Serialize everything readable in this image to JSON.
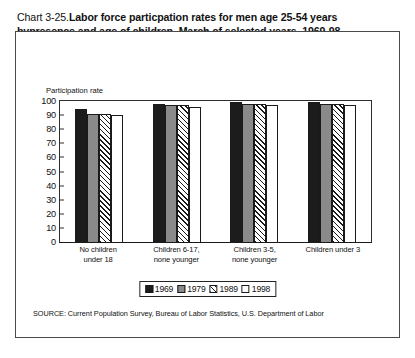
{
  "figure": {
    "title_number": "Chart 3-25.",
    "title_text": "Labor force particpation rates for men age 25-54 years bypresence and age of children, March of selected years, 1969-98",
    "source_note": "SOURCE: Current Population Survey, Bureau of Labor Statistics, U.S. Department of Labor",
    "axis_title": "Participation rate"
  },
  "chart_data": {
    "type": "bar",
    "title": "Chart 3-25.Labor force particpation rates for men age 25-54 years bypresence and age of children, March of selected years, 1969-98",
    "xlabel": "",
    "ylabel": "Participation rate",
    "ylim": [
      0,
      100
    ],
    "yticks": [
      0,
      10,
      20,
      30,
      40,
      50,
      60,
      70,
      80,
      90,
      100
    ],
    "grid": false,
    "legend_position": "bottom",
    "categories": [
      "No children under 18",
      "Children 6-17, none younger",
      "Children 3-5, none younger",
      "Children under 3"
    ],
    "category_lines": [
      [
        "No children",
        "under 18"
      ],
      [
        "Children 6-17,",
        "none younger"
      ],
      [
        "Children 3-5,",
        "none younger"
      ],
      [
        "Children under 3"
      ]
    ],
    "series": [
      {
        "name": "1969",
        "fill": "solid-black",
        "color": "#1c1c1c",
        "values": [
          94,
          98,
          99,
          99
        ]
      },
      {
        "name": "1979",
        "fill": "solid-gray",
        "color": "#8a8a8a",
        "values": [
          91,
          97,
          98,
          98
        ]
      },
      {
        "name": "1989",
        "fill": "diagonal-hatch",
        "color": "#ffffff",
        "values": [
          91,
          97,
          98,
          98
        ]
      },
      {
        "name": "1998",
        "fill": "solid-white",
        "color": "#ffffff",
        "values": [
          90,
          96,
          97,
          97
        ]
      }
    ]
  }
}
